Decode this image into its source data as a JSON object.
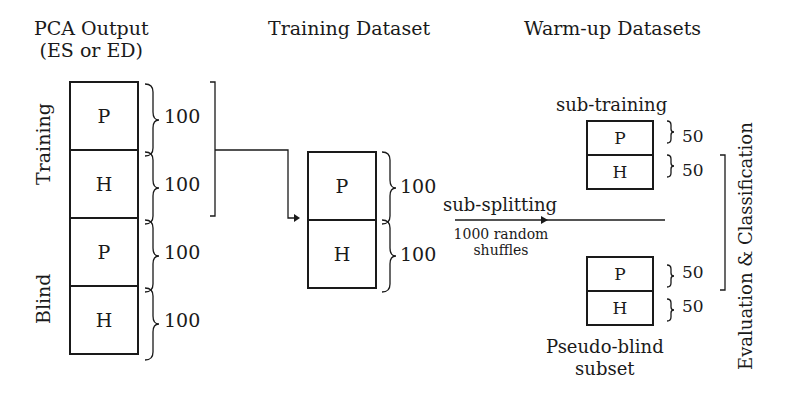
{
  "columns": {
    "pca": {
      "title_line1": "PCA Output",
      "title_line2": "(ES or ED)"
    },
    "training": {
      "title": "Training Dataset"
    },
    "warmup": {
      "title": "Warm-up Datasets"
    }
  },
  "pca_stack": {
    "group_labels": {
      "training": "Training",
      "blind": "Blind"
    },
    "blocks": [
      {
        "label": "P",
        "count": "100"
      },
      {
        "label": "H",
        "count": "100"
      },
      {
        "label": "P",
        "count": "100"
      },
      {
        "label": "H",
        "count": "100"
      }
    ]
  },
  "training_stack": {
    "blocks": [
      {
        "label": "P",
        "count": "100"
      },
      {
        "label": "H",
        "count": "100"
      }
    ]
  },
  "arrow": {
    "top_label": "sub-splitting",
    "bottom_label_line1": "1000 random",
    "bottom_label_line2": "shuffles"
  },
  "sub_training": {
    "title": "sub-training",
    "blocks": [
      {
        "label": "P",
        "count": "50"
      },
      {
        "label": "H",
        "count": "50"
      }
    ]
  },
  "pseudo_blind": {
    "title_line1": "Pseudo-blind",
    "title_line2": "subset",
    "blocks": [
      {
        "label": "P",
        "count": "50"
      },
      {
        "label": "H",
        "count": "50"
      }
    ]
  },
  "evaluation_label": "Evaluation & Classification"
}
